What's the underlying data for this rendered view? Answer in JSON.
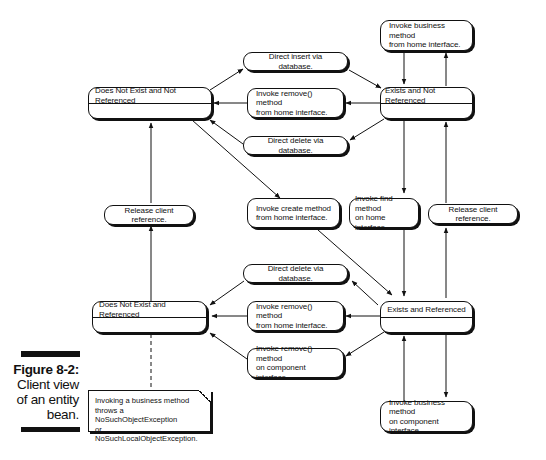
{
  "figure": {
    "label": "Figure 8-2:",
    "caption_lines": [
      "Client view",
      "of an entity",
      "bean."
    ]
  },
  "states": {
    "dne_nr": "Does Not Exist and Not Referenced",
    "e_nr": "Exists and Not Referenced",
    "dne_r": "Does Not Exist and Referenced",
    "e_r": "Exists and Referenced"
  },
  "actions": {
    "direct_insert": "Direct insert via database.",
    "remove_home_top": [
      "Invoke remove() method",
      "from home interface."
    ],
    "direct_delete_top": "Direct delete via database.",
    "business_home": [
      "Invoke business method",
      "from home interface."
    ],
    "create_home": [
      "Invoke create method",
      "from home interface."
    ],
    "find_home": [
      "Invoke find method",
      "on home interface."
    ],
    "release_left": "Release client reference.",
    "release_right": "Release client reference.",
    "direct_delete_bottom": "Direct delete via database.",
    "remove_home_bottom": [
      "Invoke remove() method",
      "from home interface."
    ],
    "remove_component": [
      "Invoke remove() method",
      "on component interface."
    ],
    "business_component": [
      "Invoke business method",
      "on component interface."
    ]
  },
  "note": {
    "lines": [
      "Invoking a business method",
      "throws a NoSuchObjectException",
      "or NoSuchLocalObjectException."
    ]
  }
}
